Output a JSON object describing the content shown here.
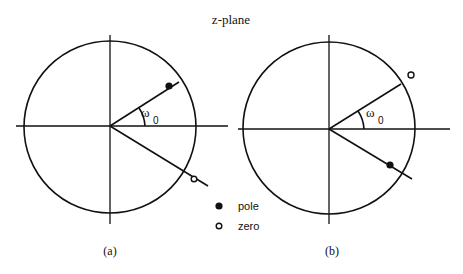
{
  "title": "z-plane",
  "omega_label": "ω",
  "omega_sub": "0",
  "legend": {
    "pole": "pole",
    "zero": "zero"
  },
  "panels": [
    {
      "label": "(a)",
      "description": "Pole inside unit circle at angle +ω0, zero outside unit circle at angle -ω0"
    },
    {
      "label": "(b)",
      "description": "Zero outside unit circle at angle +ω0, pole inside unit circle at angle -ω0"
    }
  ],
  "colors": {
    "ink": "#111111",
    "background": "#ffffff"
  }
}
